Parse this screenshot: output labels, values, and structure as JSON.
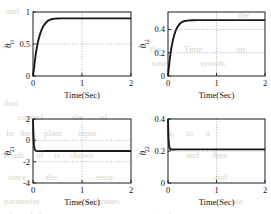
{
  "figure": {
    "background": "#ffffff",
    "ink": "#1a1a1a",
    "grid_color": "#8d8d8d",
    "bleed_color": "#d9d4cc",
    "xlabel": "Time(Sec)",
    "hat": "^",
    "theta": "θ"
  },
  "bleed_text": [
    {
      "t": "and",
      "x": 6,
      "y": 6
    },
    {
      "t": "the",
      "x": 238,
      "y": 10
    },
    {
      "t": "the",
      "x": 150,
      "y": 44
    },
    {
      "t": "Time",
      "x": 184,
      "y": 44
    },
    {
      "t": "on",
      "x": 236,
      "y": 44
    },
    {
      "t": "cases",
      "x": 152,
      "y": 58
    },
    {
      "t": "system",
      "x": 200,
      "y": 58
    },
    {
      "t": "that",
      "x": 4,
      "y": 98
    },
    {
      "t": "control",
      "x": 18,
      "y": 112
    },
    {
      "t": "the",
      "x": 72,
      "y": 112
    },
    {
      "t": "of",
      "x": 100,
      "y": 112
    },
    {
      "t": "In",
      "x": 6,
      "y": 128
    },
    {
      "t": "the",
      "x": 20,
      "y": 128
    },
    {
      "t": "plant",
      "x": 44,
      "y": 128
    },
    {
      "t": "input",
      "x": 78,
      "y": 128
    },
    {
      "t": "is",
      "x": 168,
      "y": 128
    },
    {
      "t": "to",
      "x": 186,
      "y": 128
    },
    {
      "t": "a",
      "x": 206,
      "y": 128
    },
    {
      "t": "result",
      "x": 4,
      "y": 150
    },
    {
      "t": "of",
      "x": 36,
      "y": 150
    },
    {
      "t": "is",
      "x": 54,
      "y": 150
    },
    {
      "t": "shown",
      "x": 70,
      "y": 150
    },
    {
      "t": "and",
      "x": 186,
      "y": 150
    },
    {
      "t": "then",
      "x": 212,
      "y": 150
    },
    {
      "t": "since",
      "x": 8,
      "y": 172
    },
    {
      "t": "the",
      "x": 46,
      "y": 172
    },
    {
      "t": "error",
      "x": 96,
      "y": 172
    },
    {
      "t": "and",
      "x": 214,
      "y": 172
    },
    {
      "t": "parameter",
      "x": 4,
      "y": 196
    },
    {
      "t": "estimates",
      "x": 86,
      "y": 196
    },
    {
      "t": "are",
      "x": 232,
      "y": 196
    },
    {
      "t": "bounded",
      "x": 10,
      "y": 210
    },
    {
      "t": "signal",
      "x": 150,
      "y": 210
    }
  ],
  "chart_data": [
    {
      "id": "theta11",
      "type": "line",
      "panel": "top-left",
      "title": "",
      "ylabel_base": "θ",
      "ylabel_sub": "11",
      "xlabel": "Time(Sec)",
      "xlim": [
        0,
        2
      ],
      "ylim": [
        0,
        1
      ],
      "xticks": [
        0,
        1,
        2
      ],
      "xticklabels": [
        "0",
        "1",
        "2"
      ],
      "yticks": [
        0,
        0.5,
        1
      ],
      "yticklabels": [
        "0",
        "0.5",
        "1"
      ],
      "grid": true,
      "gridlines_y": [
        0.5
      ],
      "gridlines_x": [
        1
      ],
      "steady_state": 0.9,
      "series": [
        {
          "name": "theta11_estimate",
          "x": [
            0,
            0.02,
            0.04,
            0.06,
            0.08,
            0.1,
            0.12,
            0.15,
            0.18,
            0.21,
            0.25,
            0.3,
            0.35,
            0.4,
            0.45,
            0.5,
            0.6,
            0.7,
            0.8,
            1.0,
            1.2,
            1.5,
            1.8,
            2.0
          ],
          "y": [
            0,
            0.12,
            0.25,
            0.36,
            0.45,
            0.53,
            0.59,
            0.67,
            0.73,
            0.78,
            0.82,
            0.861,
            0.881,
            0.891,
            0.896,
            0.898,
            0.9,
            0.9,
            0.9,
            0.9,
            0.9,
            0.9,
            0.9,
            0.9
          ]
        }
      ]
    },
    {
      "id": "theta12",
      "type": "line",
      "panel": "top-right",
      "title": "",
      "ylabel_base": "θ",
      "ylabel_sub": "12",
      "xlabel": "Time(Sec)",
      "xlim": [
        0,
        2
      ],
      "ylim": [
        0,
        0.55
      ],
      "xticks": [
        0,
        1,
        2
      ],
      "xticklabels": [
        "0",
        "1",
        "2"
      ],
      "yticks": [
        0,
        0.2,
        0.4
      ],
      "yticklabels": [
        "0",
        "0.2",
        "0.4"
      ],
      "grid": true,
      "gridlines_y": [
        0.2,
        0.4
      ],
      "gridlines_x": [
        1
      ],
      "steady_state": 0.48,
      "series": [
        {
          "name": "theta12_estimate",
          "x": [
            0,
            0.02,
            0.04,
            0.06,
            0.08,
            0.1,
            0.13,
            0.16,
            0.2,
            0.25,
            0.3,
            0.35,
            0.4,
            0.5,
            0.6,
            0.8,
            1.0,
            1.4,
            1.7,
            2.0
          ],
          "y": [
            0,
            0.085,
            0.155,
            0.215,
            0.265,
            0.305,
            0.355,
            0.392,
            0.425,
            0.452,
            0.466,
            0.473,
            0.476,
            0.479,
            0.48,
            0.48,
            0.48,
            0.48,
            0.48,
            0.48
          ]
        }
      ]
    },
    {
      "id": "theta21",
      "type": "line",
      "panel": "bottom-left",
      "title": "",
      "ylabel_base": "θ",
      "ylabel_sub": "21",
      "xlabel": "Time(Sec)",
      "xlim": [
        0,
        2
      ],
      "ylim": [
        -4,
        2
      ],
      "xticks": [
        0,
        1,
        2
      ],
      "xticklabels": [
        "0",
        "1",
        "2"
      ],
      "yticks": [
        -4,
        -2,
        0,
        2
      ],
      "yticklabels": [
        "-4",
        "-2",
        "0",
        "2"
      ],
      "grid": true,
      "gridlines_y": [
        -2,
        0
      ],
      "gridlines_x": [
        1
      ],
      "steady_state": -1.0,
      "series": [
        {
          "name": "theta21_estimate",
          "x": [
            0,
            0.005,
            0.012,
            0.02,
            0.03,
            0.045,
            0.06,
            0.08,
            0.1,
            0.15,
            0.25,
            0.5,
            1.0,
            1.5,
            2.0
          ],
          "y": [
            2.0,
            1.1,
            0.2,
            -0.45,
            -0.78,
            -0.93,
            -0.985,
            -1.01,
            -1.015,
            -1.01,
            -1.0,
            -1.0,
            -1.0,
            -1.0,
            -1.0
          ]
        }
      ]
    },
    {
      "id": "theta22",
      "type": "line",
      "panel": "bottom-right",
      "title": "",
      "ylabel_base": "θ",
      "ylabel_sub": "22",
      "xlabel": "Time(Sec)",
      "xlim": [
        0,
        2
      ],
      "ylim": [
        0,
        0.4
      ],
      "xticks": [
        0,
        1,
        2
      ],
      "xticklabels": [
        "0",
        "1",
        "2"
      ],
      "yticks": [
        0,
        0.2,
        0.4
      ],
      "yticklabels": [
        "0",
        "0.2",
        "0.4"
      ],
      "grid": true,
      "gridlines_y": [
        0.2
      ],
      "gridlines_x": [
        1
      ],
      "steady_state": 0.21,
      "series": [
        {
          "name": "theta22_estimate",
          "x": [
            0,
            0.005,
            0.012,
            0.02,
            0.03,
            0.045,
            0.06,
            0.08,
            0.12,
            0.2,
            0.4,
            0.8,
            1.2,
            1.6,
            2.0
          ],
          "y": [
            0.4,
            0.335,
            0.272,
            0.24,
            0.222,
            0.213,
            0.21,
            0.209,
            0.209,
            0.21,
            0.21,
            0.21,
            0.21,
            0.21,
            0.21
          ]
        }
      ]
    }
  ]
}
